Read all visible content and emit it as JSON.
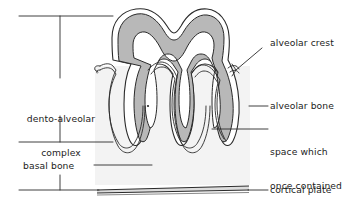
{
  "figure": {
    "background_color": "#ffffff",
    "ink_color": "#1c1c1c",
    "bone_fill_color": "#f2f2f2",
    "dentin_fill_color": "#b5b5b5",
    "pulp_fill_color": "#ffffff",
    "cortical_plate_fill_color": "#d8d8d8"
  },
  "left_labels": [
    {
      "id": "dento-alveolar-complex",
      "line1": "dento-alveolar",
      "line2": "complex"
    },
    {
      "id": "basal-bone",
      "line1": "basal bone"
    }
  ],
  "right_labels": [
    {
      "id": "alveolar-crest",
      "lines": [
        "alveolar crest"
      ]
    },
    {
      "id": "alveolar-bone",
      "lines": [
        "alveolar bone"
      ]
    },
    {
      "id": "periodontal-space",
      "lines": [
        "space which",
        "once contained",
        "the periodontal",
        "ligament"
      ]
    },
    {
      "id": "cortical-plate",
      "lines": [
        "cortical plate"
      ]
    }
  ],
  "structures": [
    {
      "name": "tooth-crown",
      "description": "molar crown with two cusps"
    },
    {
      "name": "tooth-roots",
      "description": "three roots descending into bone"
    },
    {
      "name": "alveolar-bone-block",
      "description": "light grey bone block"
    },
    {
      "name": "periodontal-ligament-space",
      "description": "white space around roots"
    },
    {
      "name": "cortical-plate-band",
      "description": "horizontal band at base"
    }
  ],
  "brackets": {
    "dento_alveolar": {
      "top_y": 16,
      "bottom_y": 142
    },
    "basal_bone": {
      "top_y": 142,
      "bottom_y": 190
    }
  }
}
